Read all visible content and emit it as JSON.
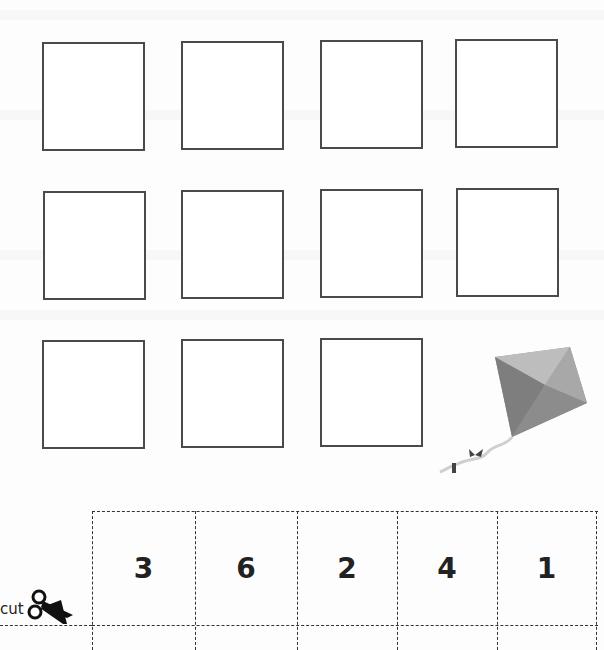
{
  "worksheet": {
    "answer_boxes": {
      "rows": [
        {
          "count": 4
        },
        {
          "count": 4
        },
        {
          "count": 3
        }
      ],
      "total": 11
    },
    "illustration": "kite-icon",
    "cut_strip": {
      "cut_label": "cut",
      "numbers": [
        "3",
        "6",
        "2",
        "4",
        "1"
      ]
    }
  },
  "colors": {
    "border": "#4a4a4a",
    "kite_gray": "#8a8a8a",
    "text": "#222222"
  }
}
